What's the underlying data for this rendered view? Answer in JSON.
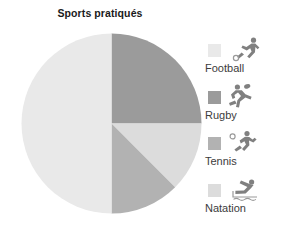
{
  "chart": {
    "title": "Sports pratiqués"
  },
  "chart_data": {
    "type": "pie",
    "title": "Sports pratiqués",
    "xlabel": "",
    "ylabel": "",
    "legend_position": "right",
    "grid": false,
    "start_angle_deg": 0,
    "direction": "clockwise",
    "categories": [
      "Football",
      "Rugby",
      "Tennis",
      "Natation"
    ],
    "values": [
      50,
      25,
      12.5,
      12.5
    ],
    "units": "percent",
    "colors": [
      "#e9e9e9",
      "#9b9b9b",
      "#b2b2b2",
      "#dcdcdc"
    ],
    "slices": [
      {
        "label": "Rugby",
        "value": 25,
        "start_deg": 0,
        "end_deg": 90,
        "color": "#9b9b9b"
      },
      {
        "label": "Natation",
        "value": 12.5,
        "start_deg": 90,
        "end_deg": 135,
        "color": "#dcdcdc"
      },
      {
        "label": "Tennis",
        "value": 12.5,
        "start_deg": 135,
        "end_deg": 180,
        "color": "#b2b2b2"
      },
      {
        "label": "Football",
        "value": 50,
        "start_deg": 180,
        "end_deg": 360,
        "color": "#e9e9e9"
      }
    ]
  },
  "legend": {
    "items": [
      {
        "label": "Football",
        "color": "#e9e9e9",
        "icon": "football-player-icon"
      },
      {
        "label": "Rugby",
        "color": "#9b9b9b",
        "icon": "rugby-player-icon"
      },
      {
        "label": "Tennis",
        "color": "#b2b2b2",
        "icon": "tennis-player-icon"
      },
      {
        "label": "Natation",
        "color": "#dcdcdc",
        "icon": "swimmer-icon"
      }
    ]
  }
}
